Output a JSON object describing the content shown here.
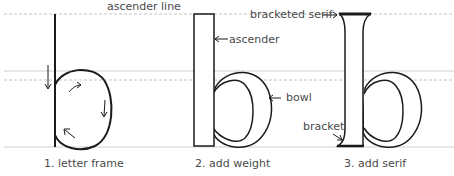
{
  "diagram": {
    "guide_labels": {
      "ascender_line": "ascender line"
    },
    "steps": [
      {
        "caption": "1. letter frame"
      },
      {
        "caption": "2. add weight"
      },
      {
        "caption": "3. add serif"
      }
    ],
    "annotations": {
      "ascender": "ascender",
      "bowl": "bowl",
      "bracketed_serif": "bracketed serif",
      "bracket": "bracket"
    },
    "colors": {
      "stroke": "#1a1a1a",
      "guide": "#c8c8c8",
      "text": "#4a4a4a"
    }
  }
}
